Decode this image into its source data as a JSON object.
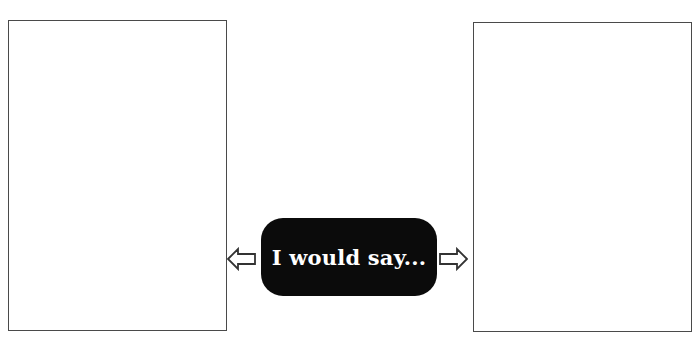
{
  "diagram": {
    "left_panel": {
      "label": ""
    },
    "right_panel": {
      "label": ""
    },
    "center_label": "I would say...",
    "arrows": [
      {
        "direction": "left",
        "icon": "arrow-left-outline-icon"
      },
      {
        "direction": "right",
        "icon": "arrow-right-outline-icon"
      }
    ],
    "colors": {
      "panel_border": "#4a4a4a",
      "pill_background": "#0b0b0b",
      "pill_text": "#ffffff",
      "arrow_stroke": "#333333"
    }
  }
}
